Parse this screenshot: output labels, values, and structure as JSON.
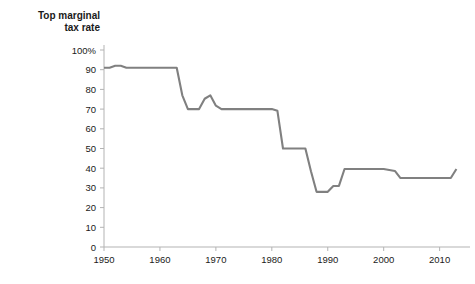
{
  "chart_data": {
    "type": "line",
    "title": "Top marginal\ntax rate",
    "xlabel": "",
    "ylabel": "",
    "xlim": [
      1950,
      2014
    ],
    "ylim": [
      0,
      100
    ],
    "grid": false,
    "legend": null,
    "yticks": [
      0,
      10,
      20,
      30,
      40,
      50,
      60,
      70,
      80,
      90,
      100
    ],
    "ytick_labels": [
      "0",
      "10",
      "20",
      "30",
      "40",
      "50",
      "60",
      "70",
      "80",
      "90",
      "100%"
    ],
    "xticks": [
      1950,
      1960,
      1970,
      1980,
      1990,
      2000,
      2010
    ],
    "xtick_labels": [
      "1950",
      "1960",
      "1970",
      "1980",
      "1990",
      "2000",
      "2010"
    ],
    "series": [
      {
        "name": "Top marginal tax rate",
        "color": "#808080",
        "x": [
          1950,
          1951,
          1952,
          1953,
          1954,
          1955,
          1956,
          1957,
          1958,
          1959,
          1960,
          1961,
          1962,
          1963,
          1964,
          1965,
          1966,
          1967,
          1968,
          1969,
          1970,
          1971,
          1972,
          1973,
          1974,
          1975,
          1976,
          1977,
          1978,
          1979,
          1980,
          1981,
          1982,
          1983,
          1984,
          1985,
          1986,
          1987,
          1988,
          1989,
          1990,
          1991,
          1992,
          1993,
          1994,
          1995,
          1996,
          1997,
          1998,
          1999,
          2000,
          2001,
          2002,
          2003,
          2004,
          2005,
          2006,
          2007,
          2008,
          2009,
          2010,
          2011,
          2012,
          2013
        ],
        "y": [
          91,
          91,
          92,
          92,
          91,
          91,
          91,
          91,
          91,
          91,
          91,
          91,
          91,
          91,
          77,
          70,
          70,
          70,
          75.25,
          77,
          71.75,
          70,
          70,
          70,
          70,
          70,
          70,
          70,
          70,
          70,
          70,
          69.125,
          50,
          50,
          50,
          50,
          50,
          38.5,
          28,
          28,
          28,
          31,
          31,
          39.6,
          39.6,
          39.6,
          39.6,
          39.6,
          39.6,
          39.6,
          39.6,
          39.1,
          38.6,
          35,
          35,
          35,
          35,
          35,
          35,
          35,
          35,
          35,
          35,
          39.6
        ]
      }
    ]
  },
  "axes": {
    "percent_suffix": "%"
  }
}
